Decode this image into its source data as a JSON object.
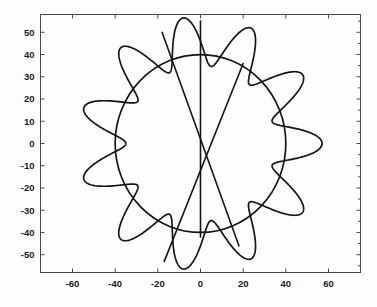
{
  "chart_data": {
    "type": "line",
    "title": "",
    "xlabel": "",
    "ylabel": "",
    "xlim": [
      -75,
      75
    ],
    "ylim": [
      -58,
      58
    ],
    "xticks": [
      -60,
      -40,
      -20,
      0,
      20,
      40,
      60
    ],
    "yticks": [
      50,
      40,
      30,
      20,
      10,
      0,
      -10,
      -20,
      -30,
      -40,
      -50
    ],
    "xtick_labels": [
      "-60",
      "-40",
      "-20",
      "0",
      "20",
      "40",
      "60"
    ],
    "ytick_labels": [
      "50",
      "40",
      "30",
      "20",
      "10",
      "0",
      "-10",
      "-20",
      "-30",
      "-40",
      "-50"
    ],
    "grid": false,
    "legend": null,
    "box": true,
    "series": [
      {
        "name": "petal-curve",
        "kind": "polar-parametric",
        "description": "Closed rosette / hypotrochoid-like curve with 11 outward lobes, radius oscillating about a mean",
        "lobes": 11,
        "r_mean": 46,
        "r_amplitude": 11,
        "r_min": 35,
        "r_max": 57,
        "phase_deg": 8,
        "color": "#151515",
        "linewidth": 1.7
      },
      {
        "name": "reference-circle",
        "kind": "circle",
        "center": [
          0,
          0
        ],
        "radius": 40,
        "color": "#151515",
        "linewidth": 1.7
      },
      {
        "name": "vertical-line",
        "kind": "segment",
        "x": [
          0,
          0
        ],
        "y": [
          55,
          -42
        ],
        "color": "#151515",
        "linewidth": 1.6
      },
      {
        "name": "diagonal-line",
        "kind": "segment",
        "x": [
          -18,
          18
        ],
        "y": [
          50,
          -46
        ],
        "color": "#151515",
        "linewidth": 1.6
      },
      {
        "name": "diagonal-line-2",
        "kind": "segment",
        "x": [
          -17,
          20
        ],
        "y": [
          -53,
          36
        ],
        "color": "#151515",
        "linewidth": 1.6
      }
    ]
  },
  "axes": {
    "frame_color": "#4a4a4a",
    "background": "#fefefe"
  }
}
